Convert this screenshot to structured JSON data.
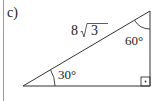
{
  "problem": {
    "part_label": "c)"
  },
  "triangle": {
    "type": "right triangle",
    "vertices": {
      "left": [
        23,
        86
      ],
      "top_right": [
        150,
        11
      ],
      "bottom_right": [
        150,
        86
      ]
    },
    "hypotenuse_label": "8√3",
    "hypotenuse_coefficient": "8",
    "hypotenuse_radicand": "3",
    "angle_left": "30°",
    "angle_top": "60°",
    "right_angle_marker": "·"
  },
  "colors": {
    "stroke": "#333333",
    "text": "#222222",
    "margin_line": "#9a9a9a"
  }
}
